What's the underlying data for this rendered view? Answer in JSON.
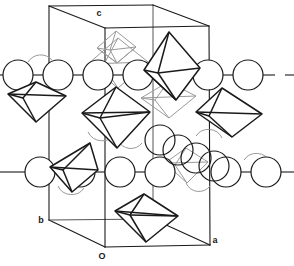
{
  "figure": {
    "background_color": "#ffffff",
    "line_color": "#1a1a1a",
    "faint_line_color": "#8a8a8a",
    "width": 294,
    "height": 266
  },
  "axes": {
    "items": [
      {
        "id": "c",
        "label": "c",
        "x": 99,
        "y": 16,
        "direction": "vertical-up"
      },
      {
        "id": "b",
        "label": "b",
        "x": 41,
        "y": 223,
        "direction": "back-left"
      },
      {
        "id": "a",
        "label": "a",
        "x": 215,
        "y": 243,
        "direction": "front-right"
      },
      {
        "id": "O",
        "label": "O",
        "x": 102,
        "y": 259,
        "direction": "origin"
      }
    ]
  },
  "unit_cell": {
    "name": "unit-cell-box",
    "vertices": {
      "origin_front_bottom_left": [
        105,
        247
      ],
      "front_bottom_right": [
        210,
        245
      ],
      "back_bottom_left": [
        49,
        220
      ],
      "back_bottom_right": [
        153,
        219
      ],
      "front_top_left": [
        105,
        28
      ],
      "front_top_right": [
        209,
        26
      ],
      "back_top_left": [
        49,
        6
      ],
      "back_top_right": [
        153,
        5
      ]
    },
    "edges": [
      [
        105,
        247,
        210,
        245
      ],
      [
        105,
        247,
        49,
        220
      ],
      [
        49,
        220,
        153,
        219
      ],
      [
        210,
        245,
        153,
        219
      ],
      [
        105,
        247,
        105,
        28
      ],
      [
        210,
        245,
        209,
        26
      ],
      [
        49,
        220,
        49,
        6
      ],
      [
        153,
        219,
        153,
        5
      ],
      [
        105,
        28,
        209,
        26
      ],
      [
        105,
        28,
        49,
        6
      ],
      [
        49,
        6,
        153,
        5
      ],
      [
        209,
        26,
        153,
        5
      ]
    ],
    "hidden_edges": [
      [
        49,
        220,
        153,
        219
      ],
      [
        153,
        219,
        210,
        245
      ],
      [
        153,
        219,
        153,
        5
      ]
    ]
  },
  "atoms": {
    "legend": "large open circles representing cations",
    "radius": 15,
    "row_upper_y": 75,
    "row_lower_y": 172,
    "row_upper": [
      {
        "cx": 18,
        "cy": 75
      },
      {
        "cx": 58,
        "cy": 75
      },
      {
        "cx": 98,
        "cy": 75
      },
      {
        "cx": 138,
        "cy": 75
      },
      {
        "cx": 208,
        "cy": 75
      },
      {
        "cx": 248,
        "cy": 75
      }
    ],
    "row_lower": [
      {
        "cx": 40,
        "cy": 172
      },
      {
        "cx": 80,
        "cy": 172
      },
      {
        "cx": 120,
        "cy": 172
      },
      {
        "cx": 160,
        "cy": 172
      },
      {
        "cx": 226,
        "cy": 172
      },
      {
        "cx": 266,
        "cy": 172
      }
    ],
    "diagonal_cluster": [
      {
        "cx": 160,
        "cy": 140
      },
      {
        "cx": 177,
        "cy": 150
      },
      {
        "cx": 195,
        "cy": 158
      },
      {
        "cx": 213,
        "cy": 166
      }
    ],
    "bond_stubs": [
      [
        0,
        75,
        3,
        75
      ],
      [
        33,
        75,
        43,
        75
      ],
      [
        73,
        75,
        83,
        75
      ],
      [
        113,
        75,
        123,
        75
      ],
      [
        153,
        75,
        163,
        75
      ],
      [
        223,
        75,
        233,
        75
      ],
      [
        263,
        75,
        273,
        75
      ],
      [
        285,
        75,
        294,
        75
      ],
      [
        0,
        172,
        25,
        172
      ],
      [
        55,
        172,
        65,
        172
      ],
      [
        95,
        172,
        105,
        172
      ],
      [
        135,
        172,
        145,
        172
      ],
      [
        241,
        172,
        251,
        172
      ],
      [
        281,
        172,
        294,
        172
      ]
    ]
  },
  "octahedra": {
    "legend": "coordination octahedra drawn in perspective as rhombi with internal edges",
    "items": [
      {
        "id": "oct-top-dashed",
        "cx": 115,
        "cy": 42,
        "rx": 22,
        "ry": 16,
        "style": "faint",
        "note": "upper back octahedron near c axis"
      },
      {
        "id": "oct-top-mid",
        "cx": 118,
        "cy": 55,
        "rx": 28,
        "ry": 18,
        "style": "faint"
      },
      {
        "id": "oct-upper-right",
        "cx": 172,
        "cy": 63,
        "rx": 28,
        "ry": 32,
        "style": "solid"
      },
      {
        "id": "oct-left-upper",
        "cx": 38,
        "cy": 100,
        "rx": 28,
        "ry": 18,
        "style": "solid"
      },
      {
        "id": "oct-center",
        "cx": 115,
        "cy": 115,
        "rx": 34,
        "ry": 28,
        "style": "solid"
      },
      {
        "id": "oct-mid-faint",
        "cx": 168,
        "cy": 100,
        "rx": 28,
        "ry": 18,
        "style": "faint"
      },
      {
        "id": "oct-right",
        "cx": 229,
        "cy": 112,
        "rx": 33,
        "ry": 22,
        "style": "solid"
      },
      {
        "id": "oct-left-lower",
        "cx": 72,
        "cy": 168,
        "rx": 26,
        "ry": 24,
        "style": "solid"
      },
      {
        "id": "oct-lower-faint",
        "cx": 186,
        "cy": 165,
        "rx": 22,
        "ry": 18,
        "style": "faint"
      },
      {
        "id": "oct-bottom",
        "cx": 146,
        "cy": 218,
        "rx": 31,
        "ry": 24,
        "style": "solid"
      }
    ]
  }
}
